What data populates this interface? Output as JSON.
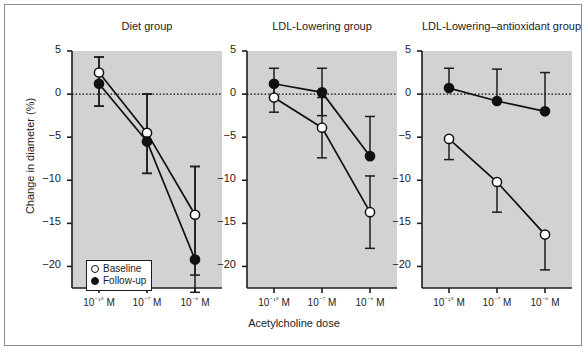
{
  "figure": {
    "ylabel": "Change in diameter (%)",
    "xlabel": "Acetylcholine dose",
    "background": "#ffffff",
    "panel_background": "#d2d2d2",
    "axis_color": "#1c1c1c"
  },
  "legend": {
    "position": "bottom-left of first panel",
    "entries": [
      {
        "label": "Baseline",
        "marker": "open-circle"
      },
      {
        "label": "Follow-up",
        "marker": "filled-circle"
      }
    ]
  },
  "chart_data": {
    "type": "line",
    "title": "",
    "xlabel": "Acetylcholine dose",
    "ylabel": "Change in diameter (%)",
    "ylim": [
      -22,
      5
    ],
    "yticks": [
      5,
      0,
      -5,
      -10,
      -15,
      -20
    ],
    "ytick_labels": [
      "5",
      "0",
      "−5",
      "−10",
      "−15",
      "−20"
    ],
    "categories": [
      "10-18 M",
      "10-7 M",
      "10-6 M"
    ],
    "xtick_labels": [
      "10⁻¹⁸ M",
      "10⁻⁷ M",
      "10⁻⁶ M"
    ],
    "grid": false,
    "zero_reference_line": 0,
    "panels": [
      {
        "title": "Diet group",
        "series": [
          {
            "name": "Baseline",
            "marker": "open-circle",
            "values": [
              2.5,
              -4.5,
              -14.0
            ],
            "err_low": [
              -1.4,
              -9.2,
              -21.0
            ],
            "err_high": [
              4.3,
              0.0,
              -8.4
            ]
          },
          {
            "name": "Follow-up",
            "marker": "filled-circle",
            "values": [
              1.2,
              -5.5,
              -19.2
            ],
            "err_low": [
              -1.4,
              -9.2,
              -23.0
            ],
            "err_high": [
              4.3,
              0.0,
              -8.4
            ]
          }
        ]
      },
      {
        "title": "LDL-Lowering group",
        "series": [
          {
            "name": "Baseline",
            "marker": "open-circle",
            "values": [
              -0.4,
              -3.9,
              -13.7
            ],
            "err_low": [
              -2.1,
              -7.4,
              -17.9
            ],
            "err_high": [
              1.0,
              -0.4,
              -9.5
            ]
          },
          {
            "name": "Follow-up",
            "marker": "filled-circle",
            "values": [
              1.2,
              0.2,
              -7.2
            ],
            "err_low": [
              -0.6,
              -2.5,
              -7.2
            ],
            "err_high": [
              3.0,
              3.0,
              -2.6
            ]
          }
        ]
      },
      {
        "title": "LDL-Lowering–antioxidant group",
        "series": [
          {
            "name": "Baseline",
            "marker": "open-circle",
            "values": [
              -5.2,
              -10.2,
              -16.3
            ],
            "err_low": [
              -7.6,
              -13.7,
              -20.4
            ],
            "err_high": [
              -5.2,
              -10.2,
              -16.3
            ]
          },
          {
            "name": "Follow-up",
            "marker": "filled-circle",
            "values": [
              0.7,
              -0.8,
              -2.0
            ],
            "err_low": [
              0.7,
              -0.8,
              -2.0
            ],
            "err_high": [
              3.0,
              2.9,
              2.5
            ]
          }
        ]
      }
    ]
  }
}
